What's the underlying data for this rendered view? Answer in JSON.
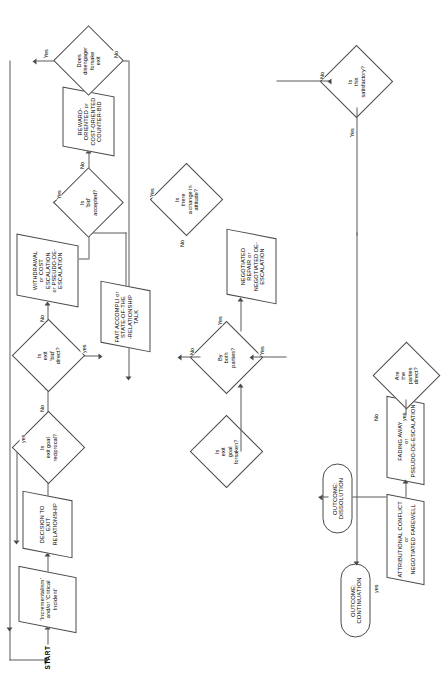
{
  "diagram": {
    "type": "flowchart",
    "orientation": "rotated-90-ccw",
    "start_label": "START",
    "nodes": [
      {
        "id": "start",
        "shape": "label",
        "text": "START"
      },
      {
        "id": "incident",
        "shape": "parallelogram",
        "text": "'Incrementalism' and/or 'Critical Incident'"
      },
      {
        "id": "decision_exit",
        "shape": "parallelogram",
        "text": "DECISION TO EXIT RELATIONSHIP"
      },
      {
        "id": "reciprocal",
        "shape": "diamond",
        "text": "Is exit goal reciprocal?"
      },
      {
        "id": "parties_direct",
        "shape": "diamond",
        "text": "Are the parties direct?"
      },
      {
        "id": "attrib",
        "shape": "parallelogram",
        "text": "ATTRIBUTIONAL CONFLICT or NEGOTIATED FAREWELL"
      },
      {
        "id": "fading",
        "shape": "parallelogram",
        "text": "FADING AWAY or PSEUDO-DE-ESCALATION"
      },
      {
        "id": "bid_direct",
        "shape": "diamond",
        "text": "Is exit 'bid' direct?"
      },
      {
        "id": "fait",
        "shape": "parallelogram",
        "text": "FAIT ACCOMPLI or STATE-OF-THE -RELATIONSHIP TALK"
      },
      {
        "id": "withdrawal",
        "shape": "parallelogram",
        "text": "WITHDRAWAL or COST ESCALATION or PSEUDO-DE-ESCALATION"
      },
      {
        "id": "bid_accepted",
        "shape": "diamond",
        "text": "Is 'bid' accepted?"
      },
      {
        "id": "reward",
        "shape": "parallelogram",
        "text": "REWARD-ORIENTED or COST-ORIENTED COUNTER-BID"
      },
      {
        "id": "disengager",
        "shape": "diamond",
        "text": "Does disengager forsake exit"
      },
      {
        "id": "change_att",
        "shape": "diamond",
        "text": "Is there a change in attitude?"
      },
      {
        "id": "goal_forsaken",
        "shape": "diamond",
        "text": "Is exit goal forsaken?"
      },
      {
        "id": "both_parties",
        "shape": "diamond",
        "text": "By both parties?"
      },
      {
        "id": "negotiated",
        "shape": "parallelogram",
        "text": "NEGOTIATED REPAIR or NEGOTIATED DE-ESCALATION"
      },
      {
        "id": "satisfactory",
        "shape": "diamond",
        "text": "Is this satisfactory?"
      },
      {
        "id": "dissolution",
        "shape": "terminator",
        "text": "OUTCOME: DISSOLUTION"
      },
      {
        "id": "continuation",
        "shape": "terminator",
        "text": "OUTCOME: CONTINUATION"
      }
    ],
    "edge_labels": {
      "reciprocal_yes": "yes",
      "reciprocal_no": "No",
      "parties_yes": "yes",
      "parties_no": "No",
      "bid_direct_yes": "yes",
      "bid_direct_no": "No",
      "bid_accepted_yes": "Yes",
      "bid_accepted_no": "No",
      "disengager_yes": "Yes",
      "disengager_no": "No",
      "change_att_yes": "Yes",
      "change_att_no": "No",
      "both_parties_yes": "Yes",
      "both_parties_no": "No",
      "satisfactory_yes": "Yes",
      "satisfactory_no": "No"
    },
    "node_text": {
      "start": "START",
      "incident_l1": "'Incrementalism'",
      "incident_l2": "and/or 'Critical",
      "incident_l3": "Incident'",
      "decision_l1": "DECISION TO",
      "decision_l2": "EXIT",
      "decision_l3": "RELATIONSHIP",
      "reciprocal_l1": "Is",
      "reciprocal_l2": "exit goal",
      "reciprocal_l3": "reciprocal?",
      "parties_l1": "Are",
      "parties_l2": "the",
      "parties_l3": "parties",
      "parties_l4": "direct?",
      "attrib_l1": "ATTRIBUTIONAL CONFLICT",
      "attrib_l2": "or",
      "attrib_l3": "NEGOTIATED FAREWELL",
      "fading_l1": "FADING AWAY",
      "fading_l2": "or",
      "fading_l3": "PSEUDO-DE-ESCALATION",
      "biddirect_l1": "Is",
      "biddirect_l2": "exit",
      "biddirect_l3": "'bid'",
      "biddirect_l4": "direct?",
      "fait_l1": "FAIT ACCOMPLI or",
      "fait_l2": "STATE-OF-THE",
      "fait_l3": "-RELATIONSHIP",
      "fait_l4": "TALK",
      "withdrawal_l1": "WITHDRAWAL",
      "withdrawal_l2": "or COST",
      "withdrawal_l3": "ESCALATION",
      "withdrawal_l4": "or PSEUDO-DE-",
      "withdrawal_l5": "ESCALATION",
      "bidacc_l1": "Is",
      "bidacc_l2": "'bid'",
      "bidacc_l3": "accepted?",
      "reward_l1": "REWARD-",
      "reward_l2": "ORIENTED or",
      "reward_l3": "COST-ORIENTED",
      "reward_l4": "COUNTER-BID",
      "diseng_l1": "Does",
      "diseng_l2": "disengager",
      "diseng_l3": "forsake",
      "diseng_l4": "exit",
      "change_l1": "Is",
      "change_l2": "there",
      "change_l3": "a change in",
      "change_l4": "attitude?",
      "forsaken_l1": "Is",
      "forsaken_l2": "exit",
      "forsaken_l3": "goal",
      "forsaken_l4": "forsaken?",
      "both_l1": "By",
      "both_l2": "both",
      "both_l3": "parties?",
      "negotiated_l1": "NEGOTIATED REPAIR or",
      "negotiated_l2": "NEGOTIATED DE-",
      "negotiated_l3": "ESCALATION",
      "satis_l1": "Is",
      "satis_l2": "this",
      "satis_l3": "satisfactory?",
      "dissolution_l1": "OUTCOME:",
      "dissolution_l2": "DISSOLUTION",
      "continuation_l1": "OUTCOME:",
      "continuation_l2": "CONTINUATION"
    },
    "colors": {
      "stroke": "#4a4a4a",
      "connector": "#5a5a5a",
      "text": "#000000",
      "background": "#ffffff"
    }
  }
}
